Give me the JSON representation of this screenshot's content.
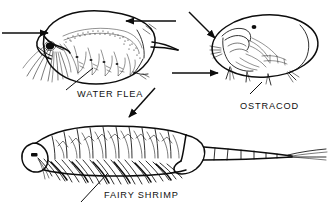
{
  "figure": {
    "kind": "scientific-line-illustration",
    "width_px": 332,
    "height_px": 213,
    "background_color": "#ffffff",
    "ink_color": "#0d0d0d"
  },
  "labels": {
    "water_flea": "WATER FLEA",
    "ostracod": "OSTRACOD",
    "fairy_shrimp": "FAIRY SHRIMP"
  },
  "specimens": [
    {
      "id": "water-flea",
      "label": "WATER FLEA",
      "position": "top-left",
      "orientation": "facing-left",
      "features": [
        "carapace",
        "branched antennae",
        "compound eye spot",
        "brood chamber",
        "thoracic legs",
        "tail spine"
      ]
    },
    {
      "id": "ostracod",
      "label": "OSTRACOD",
      "position": "top-right",
      "orientation": "facing-left",
      "features": [
        "bivalved carapace",
        "eye spot",
        "internal appendages",
        "protruding setae"
      ]
    },
    {
      "id": "fairy-shrimp",
      "label": "FAIRY SHRIMP",
      "position": "bottom",
      "orientation": "facing-left",
      "features": [
        "head with eye",
        "eleven leg-bearing segments",
        "phyllopod swimming legs",
        "segmented abdomen",
        "forked cercopods"
      ]
    }
  ],
  "annotations": {
    "pointer_count": 4,
    "leader_count": 3,
    "pointers": [
      {
        "id": "water-flea-head-pointer",
        "target": "water flea head and antennae",
        "direction": "right"
      },
      {
        "id": "water-flea-dorsal-pointer",
        "target": "water flea dorsal carapace",
        "direction": "left"
      },
      {
        "id": "ostracod-upper-pointer",
        "target": "ostracod anterior carapace",
        "direction": "down-right"
      },
      {
        "id": "ostracod-lower-pointer",
        "target": "ostracod ventral setae",
        "direction": "right"
      },
      {
        "id": "fairy-shrimp-dorsal-pointer",
        "target": "fairy shrimp dorsal surface",
        "direction": "down-left"
      }
    ],
    "leaders": [
      {
        "id": "water-flea-leader",
        "from": "WATER FLEA label",
        "to": "thoracic legs"
      },
      {
        "id": "ostracod-leader",
        "from": "OSTRACOD label",
        "to": "ventral carapace margin"
      },
      {
        "id": "fairy-shrimp-leader",
        "from": "FAIRY SHRIMP label",
        "to": "swimming legs"
      }
    ]
  }
}
